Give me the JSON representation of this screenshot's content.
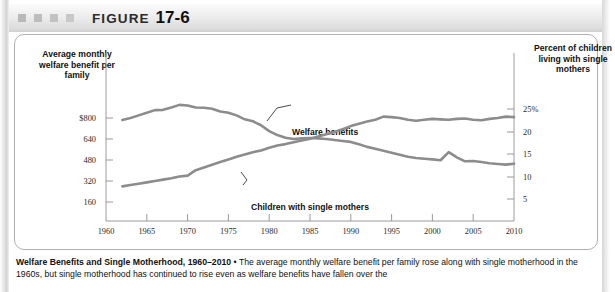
{
  "header": {
    "figure_word": "FIGURE",
    "figure_number": "17-6",
    "decor_squares": 4
  },
  "chart_data": {
    "type": "line",
    "xlabel": "",
    "ylabel_left": "Average monthly welfare benefit per family",
    "ylabel_right": "Percent of children living with single mothers",
    "xlim": [
      1960,
      2010
    ],
    "ylim_left": [
      0,
      960
    ],
    "ylim_right": [
      0,
      30
    ],
    "grid": false,
    "legend_position": "inline-annotations",
    "xticks": [
      1960,
      1965,
      1970,
      1975,
      1980,
      1985,
      1990,
      1995,
      2000,
      2005,
      2010
    ],
    "xtick_labels": [
      "1960",
      "1965",
      "1970",
      "1975",
      "1980",
      "1985",
      "1990",
      "1995",
      "2000",
      "2005",
      "2010"
    ],
    "yticks_left": [
      800,
      640,
      480,
      320,
      160
    ],
    "ytick_labels_left": [
      "$800",
      "640",
      "480",
      "320",
      "160"
    ],
    "yticks_right": [
      25,
      20,
      15,
      10,
      5
    ],
    "ytick_labels_right": [
      "25%",
      "20",
      "15",
      "10",
      "5"
    ],
    "line_color": "#8c8c8c",
    "series": [
      {
        "name": "Welfare benefits",
        "axis": "left",
        "units": "dollars per month",
        "x": [
          1962,
          1963,
          1964,
          1965,
          1966,
          1967,
          1968,
          1969,
          1970,
          1971,
          1972,
          1973,
          1974,
          1975,
          1976,
          1977,
          1978,
          1979,
          1980,
          1981,
          1982,
          1983,
          1984,
          1985,
          1986,
          1987,
          1988,
          1989,
          1990,
          1991,
          1992,
          1993,
          1994,
          1995,
          1996,
          1997,
          1998,
          1999,
          2000,
          2001,
          2002,
          2003,
          2004,
          2005,
          2006,
          2007,
          2008,
          2009,
          2010
        ],
        "values": [
          785,
          800,
          820,
          840,
          860,
          862,
          880,
          900,
          895,
          880,
          878,
          870,
          850,
          840,
          820,
          790,
          775,
          745,
          700,
          670,
          650,
          640,
          645,
          648,
          645,
          640,
          632,
          625,
          618,
          600,
          580,
          565,
          550,
          535,
          520,
          505,
          495,
          490,
          485,
          478,
          540,
          500,
          470,
          472,
          465,
          455,
          450,
          445,
          452
        ]
      },
      {
        "name": "Children with single mothers",
        "axis": "right",
        "units": "percent",
        "x": [
          1962,
          1963,
          1964,
          1965,
          1966,
          1967,
          1968,
          1969,
          1970,
          1971,
          1972,
          1973,
          1974,
          1975,
          1976,
          1977,
          1978,
          1979,
          1980,
          1981,
          1982,
          1983,
          1984,
          1985,
          1986,
          1987,
          1988,
          1989,
          1990,
          1991,
          1992,
          1993,
          1994,
          1995,
          1996,
          1997,
          1998,
          1999,
          2000,
          2001,
          2002,
          2003,
          2004,
          2005,
          2006,
          2007,
          2008,
          2009,
          2010
        ],
        "values": [
          7.8,
          8.1,
          8.4,
          8.7,
          9.0,
          9.3,
          9.6,
          10.0,
          10.2,
          11.4,
          12.0,
          12.6,
          13.2,
          13.8,
          14.4,
          14.9,
          15.4,
          15.8,
          16.4,
          16.9,
          17.2,
          17.6,
          18.0,
          18.4,
          18.9,
          19.4,
          19.9,
          20.5,
          21.2,
          21.7,
          22.2,
          22.6,
          23.3,
          23.2,
          23.0,
          22.6,
          22.4,
          22.6,
          22.8,
          22.7,
          22.6,
          22.8,
          22.9,
          22.6,
          22.5,
          22.8,
          23.0,
          23.3,
          23.2
        ]
      }
    ],
    "annotations": [
      {
        "text": "Welfare benefits",
        "x": 1988,
        "y_left": 760
      },
      {
        "text": "Children with single mothers",
        "x": 1977,
        "y_right": 12
      }
    ]
  },
  "caption": {
    "bold_part": "Welfare Benefits and Single Motherhood, 1960–2010",
    "separator": " • ",
    "body": "The average monthly welfare benefit per family rose along with single motherhood in the 1960s, but single motherhood has continued to rise even as welfare benefits have fallen over the"
  }
}
